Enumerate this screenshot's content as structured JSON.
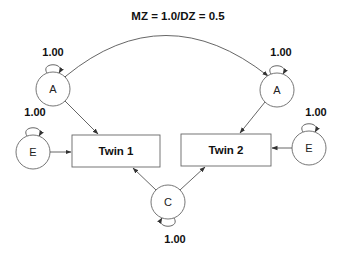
{
  "diagram": {
    "title": "MZ = 1.0/DZ = 0.5",
    "nodes": {
      "a1": {
        "label": "A",
        "variance": "1.00"
      },
      "a2": {
        "label": "A",
        "variance": "1.00"
      },
      "e1": {
        "label": "E",
        "variance": "1.00"
      },
      "e2": {
        "label": "E",
        "variance": "1.00"
      },
      "c": {
        "label": "C",
        "variance": "1.00"
      }
    },
    "observed": {
      "twin1": {
        "label": "Twin 1"
      },
      "twin2": {
        "label": "Twin 2"
      }
    },
    "edges": [
      {
        "from": "A",
        "to": "Twin 1"
      },
      {
        "from": "E",
        "to": "Twin 1"
      },
      {
        "from": "C",
        "to": "Twin 1"
      },
      {
        "from": "A",
        "to": "Twin 2"
      },
      {
        "from": "E",
        "to": "Twin 2"
      },
      {
        "from": "C",
        "to": "Twin 2"
      },
      {
        "from": "A",
        "to": "A",
        "type": "covariance",
        "label": "MZ = 1.0/DZ = 0.5"
      }
    ]
  }
}
